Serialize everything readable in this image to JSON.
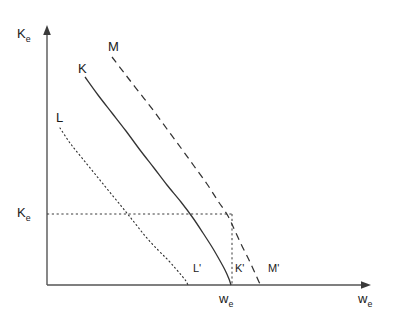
{
  "figure": {
    "background_color": "#ffffff",
    "line_color": "#333333",
    "axis_color": "#555555"
  },
  "axes": {
    "y_label_main": "K",
    "y_label_sub": "e",
    "x_label_main": "w",
    "x_label_sub": "e",
    "origin_px": [
      47,
      285
    ],
    "y_axis_top_px": [
      47,
      27
    ],
    "x_axis_right_px": [
      370,
      285
    ]
  },
  "curves": {
    "M": {
      "label": "M",
      "style": "dashed",
      "endpoint_label": "M'"
    },
    "K": {
      "label": "K",
      "style": "solid",
      "endpoint_label": "K'"
    },
    "L": {
      "label": "L",
      "style": "dotted",
      "endpoint_label": "L'"
    }
  },
  "guides": {
    "y_tick_main": "K",
    "y_tick_sub": "e",
    "x_tick_main": "w",
    "x_tick_sub": "e",
    "style": "dotted"
  },
  "chart_data": {
    "type": "line",
    "title": "",
    "xlabel": "w_e",
    "ylabel": "K_e",
    "xlim": [
      0,
      1
    ],
    "ylim": [
      0,
      1
    ],
    "grid": false,
    "legend": "inline-curve-labels",
    "series": [
      {
        "name": "L",
        "label": "L",
        "style": "dotted",
        "endpoint_label": "L'",
        "comment": "innermost downward-sloping convex isoquant-like curve",
        "points_px": [
          [
            60,
            128
          ],
          [
            70,
            143
          ],
          [
            82,
            158
          ],
          [
            95,
            174
          ],
          [
            108,
            190
          ],
          [
            122,
            207
          ],
          [
            134,
            222
          ],
          [
            146,
            237
          ],
          [
            158,
            250
          ],
          [
            168,
            260
          ],
          [
            176,
            269
          ],
          [
            182,
            276
          ],
          [
            186,
            281
          ],
          [
            188,
            285
          ]
        ]
      },
      {
        "name": "K",
        "label": "K",
        "style": "solid",
        "endpoint_label": "K'",
        "comment": "middle curve; intersects the K_e horizontal guide",
        "points_px": [
          [
            85,
            77
          ],
          [
            98,
            95
          ],
          [
            112,
            113
          ],
          [
            126,
            131
          ],
          [
            140,
            150
          ],
          [
            154,
            168
          ],
          [
            167,
            185
          ],
          [
            181,
            202
          ],
          [
            193,
            218
          ],
          [
            203,
            233
          ],
          [
            212,
            247
          ],
          [
            219,
            259
          ],
          [
            225,
            270
          ],
          [
            229,
            279
          ],
          [
            231,
            285
          ]
        ]
      },
      {
        "name": "M",
        "label": "M",
        "style": "dashed",
        "endpoint_label": "M'",
        "comment": "outermost curve; meets the K_e guide where the w_e vertical drops",
        "points_px": [
          [
            112,
            57
          ],
          [
            125,
            74
          ],
          [
            139,
            92
          ],
          [
            153,
            110
          ],
          [
            167,
            129
          ],
          [
            181,
            148
          ],
          [
            194,
            166
          ],
          [
            207,
            184
          ],
          [
            218,
            201
          ],
          [
            228,
            216
          ],
          [
            235,
            231
          ],
          [
            242,
            246
          ],
          [
            249,
            260
          ],
          [
            255,
            273
          ],
          [
            259,
            282
          ],
          [
            261,
            285
          ]
        ]
      }
    ],
    "annotations": [
      {
        "name": "horizontal-guide",
        "style": "dotted",
        "from_px": [
          47,
          214
        ],
        "to_px": [
          232,
          214
        ],
        "label": "K_e"
      },
      {
        "name": "vertical-guide",
        "style": "dotted",
        "from_px": [
          232,
          214
        ],
        "to_px": [
          232,
          285
        ],
        "label": "w_e"
      }
    ]
  }
}
